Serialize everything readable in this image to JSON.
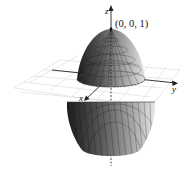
{
  "figure": {
    "axes": {
      "x_label": "x",
      "y_label": "y",
      "z_label": "z"
    },
    "point_label": "(0, 0, 1)",
    "colors": {
      "surface_dark": "#2a2a2a",
      "surface_light": "#d9d9d9",
      "grid": "#d6d6d6",
      "axis": "#222222"
    }
  }
}
